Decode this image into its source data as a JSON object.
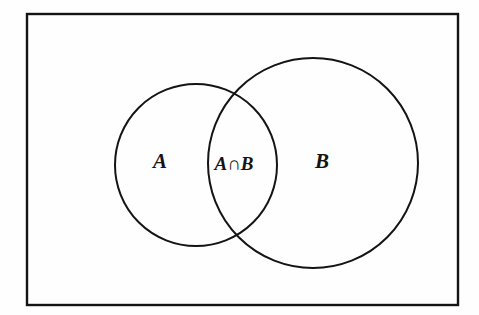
{
  "figure": {
    "type": "venn-diagram",
    "background_color": "#fefefe",
    "stroke_color": "#141414"
  },
  "universe": {
    "name": "universal-set-rectangle",
    "x": 27,
    "y": 14,
    "width": 431,
    "height": 291,
    "stroke_width": 2.4
  },
  "sets": [
    {
      "id": "A",
      "label": "A",
      "name": "set-a-circle",
      "cx": 196,
      "cy": 165,
      "r": 81,
      "label_x": 160,
      "label_y": 168,
      "stroke_width": 2.0
    },
    {
      "id": "B",
      "label": "B",
      "name": "set-b-circle",
      "cx": 313,
      "cy": 163,
      "r": 105,
      "label_x": 322,
      "label_y": 168,
      "stroke_width": 2.0
    }
  ],
  "intersection": {
    "name": "intersection-region",
    "label": "A∩B",
    "label_x": 234,
    "label_y": 170,
    "upper_crossing": "222, 97",
    "lower_crossing": "228, 235"
  },
  "colors": {
    "stroke": "#141414",
    "background": "#fefefe",
    "text": "#141414"
  }
}
